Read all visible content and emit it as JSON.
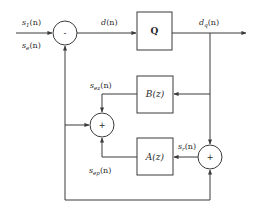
{
  "diagram": {
    "type": "block-diagram",
    "blocks": [
      {
        "id": "Q",
        "label": "Q"
      },
      {
        "id": "B",
        "label": "B(z)"
      },
      {
        "id": "A",
        "label": "A(z)"
      }
    ],
    "summing_junctions": [
      {
        "id": "sum_top",
        "sign": "-"
      },
      {
        "id": "sum_mid",
        "sign": "+"
      },
      {
        "id": "sum_right",
        "sign": "+"
      }
    ],
    "signals": {
      "s1": {
        "base": "s",
        "sub": "1",
        "arg": "(n)"
      },
      "se": {
        "base": "s",
        "sub": "e",
        "arg": "(n)"
      },
      "d": {
        "base": "d",
        "sub": "",
        "arg": "(n)"
      },
      "dq": {
        "base": "d",
        "sub": "q",
        "arg": "(n)"
      },
      "sez": {
        "base": "s",
        "sub": "ez",
        "arg": "(n)"
      },
      "sep": {
        "base": "s",
        "sub": "ep",
        "arg": "(n)"
      },
      "sr": {
        "base": "s",
        "sub": "r",
        "arg": "(n)"
      }
    },
    "connections": [
      [
        "s1(n)",
        "sum_top"
      ],
      [
        "sum_top",
        "Q",
        "d(n)"
      ],
      [
        "Q",
        "output",
        "dq(n)"
      ],
      [
        "dq(n)",
        "B(z)"
      ],
      [
        "dq(n)",
        "sum_right"
      ],
      [
        "B(z)",
        "sum_mid",
        "sez(n)"
      ],
      [
        "sum_right",
        "A(z)",
        "sr(n)"
      ],
      [
        "A(z)",
        "sum_mid",
        "sep(n)"
      ],
      [
        "sum_mid",
        "sum_right"
      ],
      [
        "sum_mid",
        "sum_top",
        "se(n)"
      ]
    ]
  }
}
